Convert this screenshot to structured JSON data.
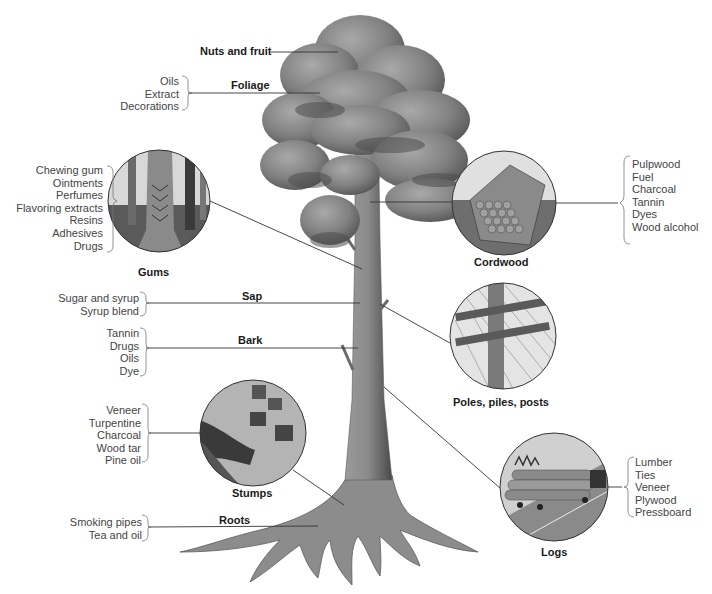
{
  "diagram": {
    "palette": {
      "foliage_dark": "#4a4a4a",
      "foliage_mid": "#7d7d7d",
      "foliage_light": "#a8a8a8",
      "trunk": "#8a8a8a",
      "line": "#333333",
      "list_text": "#444444"
    }
  },
  "parts": {
    "nuts_fruit": {
      "label": "Nuts and fruit"
    },
    "foliage": {
      "label": "Foliage",
      "products": [
        "Oils",
        "Extract",
        "Decorations"
      ]
    },
    "gums": {
      "label": "Gums",
      "products": [
        "Chewing gum",
        "Ointments",
        "Perfumes",
        "Flavoring extracts",
        "Resins",
        "Adhesives",
        "Drugs"
      ]
    },
    "cordwood": {
      "label": "Cordwood",
      "products": [
        "Pulpwood",
        "Fuel",
        "Charcoal",
        "Tannin",
        "Dyes",
        "Wood alcohol"
      ]
    },
    "sap": {
      "label": "Sap",
      "products": [
        "Sugar and syrup",
        "Syrup blend"
      ]
    },
    "bark": {
      "label": "Bark",
      "products": [
        "Tannin",
        "Drugs",
        "Oils",
        "Dye"
      ]
    },
    "poles": {
      "label": "Poles, piles, posts"
    },
    "stumps": {
      "label": "Stumps",
      "products": [
        "Veneer",
        "Turpentine",
        "Charcoal",
        "Wood tar",
        "Pine oil"
      ]
    },
    "logs": {
      "label": "Logs",
      "products": [
        "Lumber",
        "Ties",
        "Veneer",
        "Plywood",
        "Pressboard"
      ]
    },
    "roots": {
      "label": "Roots",
      "products": [
        "Smoking pipes",
        "Tea and oil"
      ]
    }
  }
}
